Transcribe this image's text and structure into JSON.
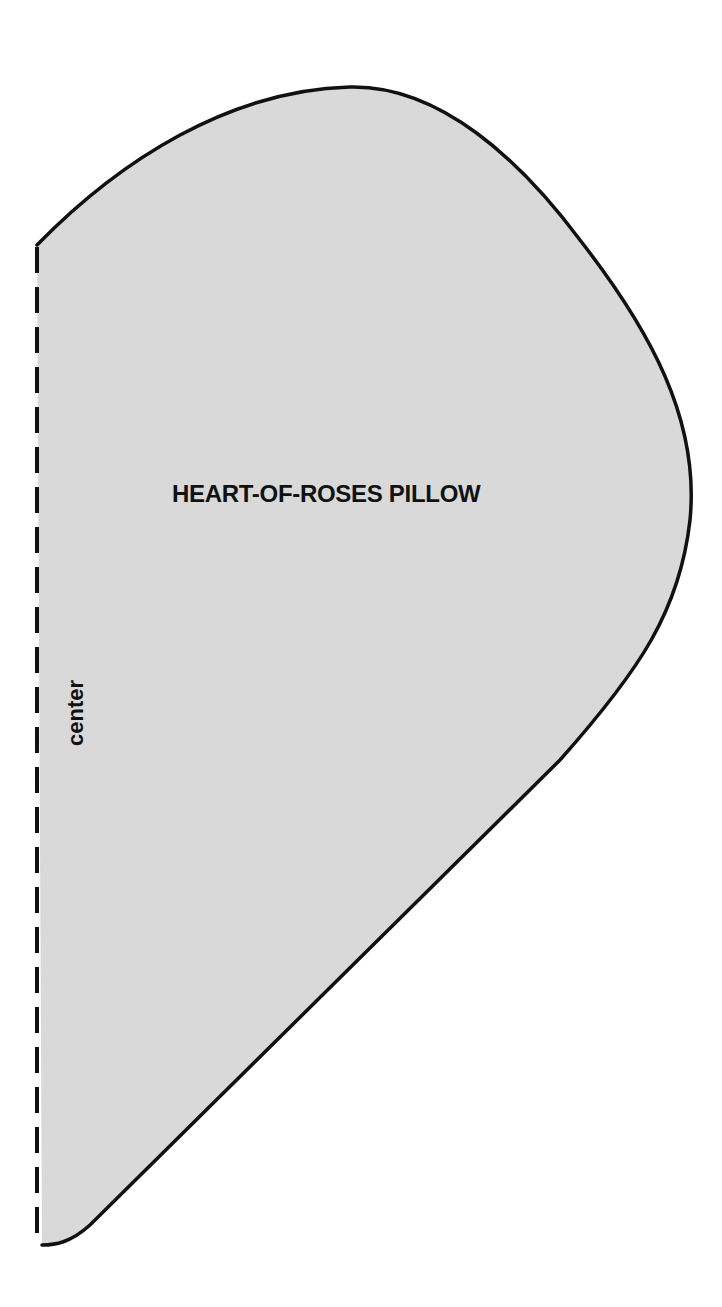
{
  "pattern": {
    "title": "HEART-OF-ROSES PILLOW",
    "fold_line_label": "center",
    "fill_color": "#d9d9d9",
    "outline_color": "#111111"
  }
}
